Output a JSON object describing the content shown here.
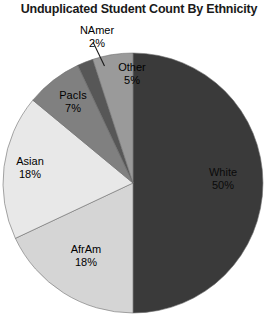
{
  "chart_data": {
    "type": "pie",
    "title": "Unduplicated Student Count By Ethnicity",
    "xlabel": "",
    "ylabel": "",
    "legend": "none",
    "grid": false,
    "labels_inside": true,
    "start_angle_deg": 0,
    "direction": "clockwise",
    "categories": [
      "White",
      "AfrAm",
      "Asian",
      "PacIs",
      "NAmer",
      "Other"
    ],
    "values": [
      50,
      18,
      18,
      7,
      2,
      5
    ],
    "value_suffix": "%",
    "slices": [
      {
        "name": "White",
        "value": 50,
        "value_text": "50%",
        "color": "#3a3a3a",
        "label_color": "#0a0a0a"
      },
      {
        "name": "AfrAm",
        "value": 18,
        "value_text": "18%",
        "color": "#d5d5d5",
        "label_color": "#000000"
      },
      {
        "name": "Asian",
        "value": 18,
        "value_text": "18%",
        "color": "#e8e8e8",
        "label_color": "#000000"
      },
      {
        "name": "PacIs",
        "value": 7,
        "value_text": "7%",
        "color": "#808080",
        "label_color": "#000000"
      },
      {
        "name": "NAmer",
        "value": 2,
        "value_text": "2%",
        "color": "#575757",
        "label_color": "#000000"
      },
      {
        "name": "Other",
        "value": 5,
        "value_text": "5%",
        "color": "#9a9a9a",
        "label_color": "#000000"
      }
    ]
  },
  "colors": {
    "background": "#ffffff",
    "title": "#1a1a1a",
    "outline": "#6e6e6e",
    "leader_line": "#1a1a1a"
  }
}
